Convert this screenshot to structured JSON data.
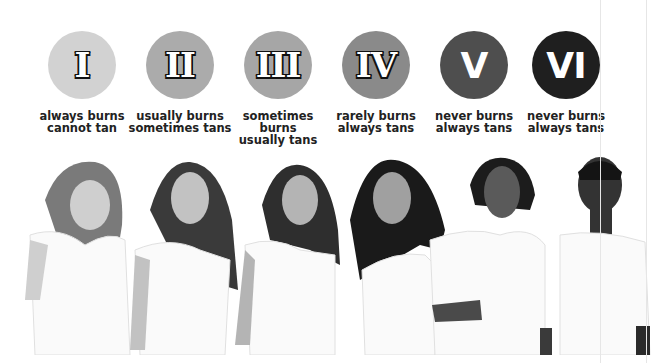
{
  "figure": {
    "types": [
      {
        "numeral": "I",
        "line1": "always burns",
        "line2": "cannot tan",
        "color": "#d2d2d2",
        "skin": "#c9c9c9",
        "hair": "#7a7a7a"
      },
      {
        "numeral": "II",
        "line1": "usually burns",
        "line2": "sometimes tans",
        "color": "#ababab",
        "skin": "#bdbdbd",
        "hair": "#3a3a3a"
      },
      {
        "numeral": "III",
        "line1": "sometimes burns",
        "line2": "usually tans",
        "color": "#a6a6a6",
        "skin": "#b0b0b0",
        "hair": "#2e2e2e"
      },
      {
        "numeral": "IV",
        "line1": "rarely burns",
        "line2": "always tans",
        "color": "#8a8a8a",
        "skin": "#9a9a9a",
        "hair": "#1a1a1a"
      },
      {
        "numeral": "V",
        "line1": "never burns",
        "line2": "always tans",
        "color": "#4e4e4e",
        "skin": "#5a5a5a",
        "hair": "#1c1c1c"
      },
      {
        "numeral": "VI",
        "line1": "never burns",
        "line2": "always tans",
        "color": "#1f1f1f",
        "skin": "#333333",
        "hair": "#141414"
      }
    ]
  }
}
